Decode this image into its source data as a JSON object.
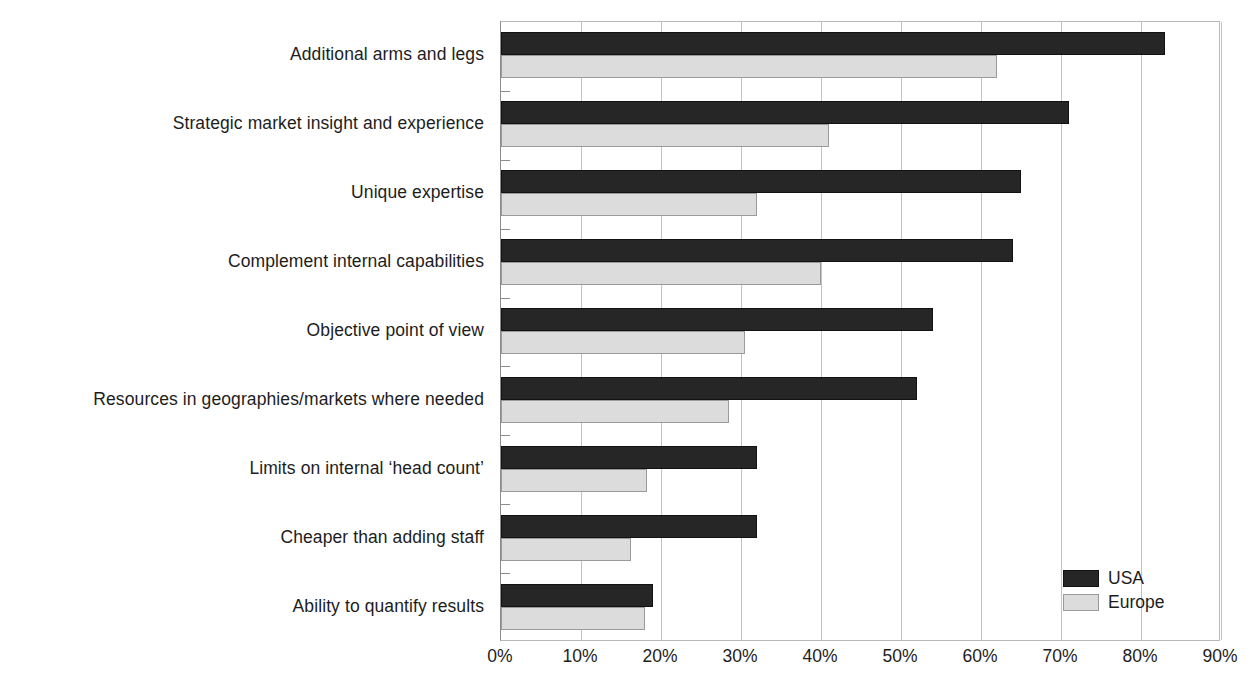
{
  "chart_data": {
    "type": "bar",
    "orientation": "horizontal",
    "title": "",
    "xlabel": "",
    "ylabel": "",
    "xlim": [
      0,
      90
    ],
    "xtick_labels": [
      "0%",
      "10%",
      "20%",
      "30%",
      "40%",
      "50%",
      "60%",
      "70%",
      "80%",
      "90%"
    ],
    "xticks": [
      0,
      10,
      20,
      30,
      40,
      50,
      60,
      70,
      80,
      90
    ],
    "grid": true,
    "grid_axis": "x",
    "legend_position": "bottom-right",
    "categories": [
      "Additional arms and legs",
      "Strategic market insight and experience",
      "Unique expertise",
      "Complement internal capabilities",
      "Objective point of view",
      "Resources in geographies/markets where needed",
      "Limits on internal ‘head count’",
      "Cheaper than adding staff",
      "Ability to quantify results"
    ],
    "series": [
      {
        "name": "USA",
        "color": "#262626",
        "values": [
          83,
          71,
          65,
          64,
          54,
          52,
          32,
          32,
          19
        ]
      },
      {
        "name": "Europe",
        "color": "#dcdcdc",
        "values": [
          62,
          41,
          32,
          40,
          30.5,
          28.5,
          18.3,
          16.2,
          18
        ]
      }
    ]
  },
  "legend": {
    "items": [
      {
        "label": "USA",
        "swatch": "usa"
      },
      {
        "label": "Europe",
        "swatch": "europe"
      }
    ]
  },
  "colors": {
    "usa_fill": "#262626",
    "usa_border": "#121212",
    "europe_fill": "#dcdcdc",
    "europe_border": "#9a9a9a",
    "gridline": "#c2c2c2",
    "axis": "#8c8c8c",
    "text": "#1d1d1d",
    "background": "#ffffff"
  }
}
